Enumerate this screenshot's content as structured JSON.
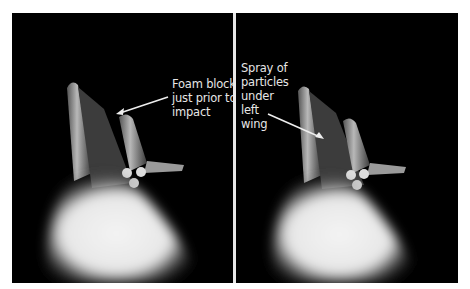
{
  "figure": {
    "panels": [
      {
        "id": "left",
        "caption_lines": [
          "Foam block",
          "just prior to",
          "impact"
        ],
        "caption": "Foam block\njust prior to\nimpact"
      },
      {
        "id": "right",
        "caption_lines": [
          "Spray of",
          "particles",
          "under",
          "left",
          "wing"
        ],
        "caption": "Spray of\nparticles\nunder\nleft\nwing"
      }
    ],
    "colors": {
      "background": "#000000",
      "plume": "#f2f2f2",
      "caption": "#e6e6e6",
      "frame": "#ffffff"
    }
  }
}
